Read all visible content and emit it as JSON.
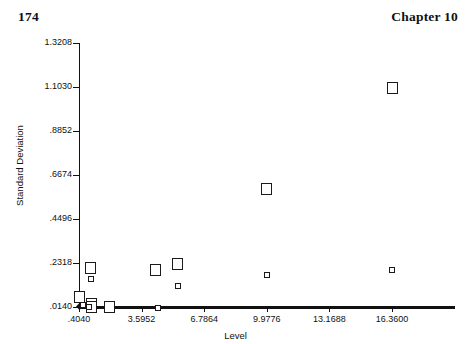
{
  "header": {
    "page_number": "174",
    "chapter": "Chapter 10"
  },
  "chart_data": {
    "type": "scatter",
    "title": "",
    "xlabel": "Level",
    "ylabel": "Standard Deviation",
    "grid": false,
    "legend": "none",
    "xlim": [
      0.404,
      18.4
    ],
    "ylim": [
      0.014,
      1.3208
    ],
    "xticks": [
      ".4040",
      "3.5952",
      "6.7864",
      "9.9776",
      "13.1688",
      "16.3600"
    ],
    "xtick_values": [
      0.404,
      3.5952,
      6.7864,
      9.9776,
      13.1688,
      16.36
    ],
    "yticks": [
      "1.3208",
      "1.1030",
      ".8852",
      ".6674",
      ".4496",
      ".2318",
      ".0140"
    ],
    "ytick_values": [
      1.3208,
      1.103,
      0.8852,
      0.6674,
      0.4496,
      0.2318,
      0.014
    ],
    "series": [
      {
        "name": "large-markers",
        "marker": "open-square-large",
        "points": [
          {
            "x": 0.45,
            "y": 0.062
          },
          {
            "x": 1.0,
            "y": 0.208
          },
          {
            "x": 1.02,
            "y": 0.028
          },
          {
            "x": 1.05,
            "y": 0.012
          },
          {
            "x": 1.95,
            "y": 0.012
          },
          {
            "x": 4.3,
            "y": 0.196
          },
          {
            "x": 5.45,
            "y": 0.229
          },
          {
            "x": 9.9776,
            "y": 0.6
          },
          {
            "x": 16.36,
            "y": 1.098
          }
        ]
      },
      {
        "name": "small-markers",
        "marker": "open-square-small",
        "points": [
          {
            "x": 1.0,
            "y": 0.155
          },
          {
            "x": 0.62,
            "y": 0.022
          },
          {
            "x": 0.9,
            "y": 0.016
          },
          {
            "x": 5.45,
            "y": 0.118
          },
          {
            "x": 4.45,
            "y": 0.007
          },
          {
            "x": 9.9776,
            "y": 0.173
          },
          {
            "x": 16.36,
            "y": 0.196
          }
        ]
      }
    ]
  }
}
